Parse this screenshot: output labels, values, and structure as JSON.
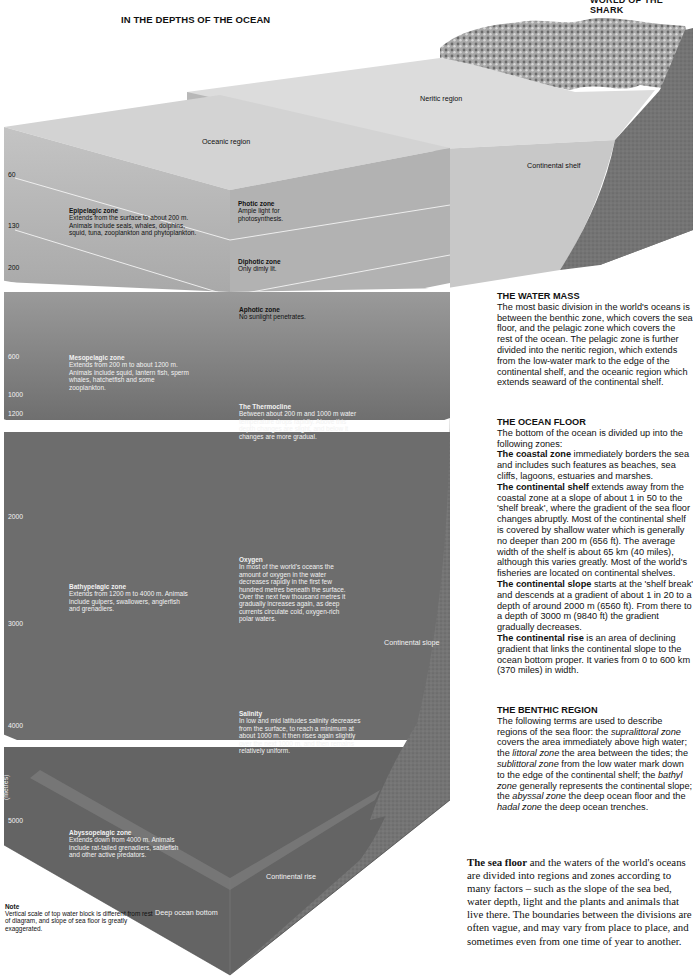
{
  "header": {
    "title": "IN THE DEPTHS OF THE OCEAN",
    "running_head": "WORLD OF THE SHARK"
  },
  "diagram": {
    "regions": {
      "neritic": "Neritic region",
      "oceanic": "Oceanic region",
      "continental_shelf": "Continental shelf",
      "continental_slope": "Continental slope",
      "continental_rise": "Continental rise",
      "deep_ocean_bottom": "Deep ocean bottom"
    },
    "depth_axis": {
      "unit_label": "(metres)",
      "ticks": [
        "60",
        "130",
        "200",
        "600",
        "1000",
        "1200",
        "2000",
        "3000",
        "4000",
        "5000"
      ]
    },
    "zones": [
      {
        "title": "Epipelagic zone",
        "text": "Extends from the surface to about 200 m. Animals include seals, whales, dolphins, squid, tuna, zooplankton and phytoplankton."
      },
      {
        "title": "Mesopelagic zone",
        "text": "Extends from 200 m to about 1200 m. Animals include squid, lantern fish, sperm whales, hatchetfish and some zooplankton."
      },
      {
        "title": "Bathypelagic zone",
        "text": "Extends from 1200 m to 4000 m. Animals include gulpers, swallowers, anglerfish and grenadiers."
      },
      {
        "title": "Abyssopelagic zone",
        "text": "Extends down from 4000 m. Animals include rat-tailed grenadiers, sablefish and other active predators."
      }
    ],
    "light_zones": [
      {
        "title": "Photic zone",
        "text": "Ample light for photosynthesis."
      },
      {
        "title": "Diphotic zone",
        "text": "Only dimly lit."
      },
      {
        "title": "Aphotic zone",
        "text": "No sunlight penetrates."
      }
    ],
    "properties": [
      {
        "title": "The Thermocline",
        "text": "Between about 200 m and 1000 m water temperature drops rapidly. Above this depth changes are slight, and below it changes are more gradual."
      },
      {
        "title": "Oxygen",
        "text": "In most of the world's oceans the amount of oxygen in the water decreases rapidly in the first few hundred metres beneath the surface. Over the next few thousand metres it gradually increases again, as deep currents circulate cold, oxygen-rich polar waters."
      },
      {
        "title": "Salinity",
        "text": "In low and mid latitudes salinity decreases from the surface, to reach a minimum at about 1000 m. It then rises again slightly over the next 1000 m, and then remains relatively uniform."
      }
    ],
    "note": {
      "title": "Note",
      "text": "Vertical scale of top water block is different from rest of diagram, and slope of sea floor is greatly exaggerated."
    }
  },
  "sidebar": {
    "water_mass": {
      "heading": "THE WATER MASS",
      "text": "The most basic division in the world's oceans is between the benthic zone, which covers the sea floor, and the pelagic zone which covers the rest of the ocean. The pelagic zone is further divided into the neritic region, which extends from the low-water mark to the edge of the continental shelf, and the oceanic region which extends seaward of the continental shelf."
    },
    "ocean_floor": {
      "heading": "THE OCEAN FLOOR",
      "intro": "The bottom of the ocean is divided up into the following zones:",
      "items": [
        {
          "term": "The coastal zone",
          "text": " immediately borders the sea and includes such features as beaches, sea cliffs, lagoons, estuaries and marshes."
        },
        {
          "term": "The continental shelf",
          "text": " extends away from the coastal zone at a slope of about 1 in 50 to the 'shelf break', where the gradient of the sea floor changes abruptly. Most of the continental shelf is covered by shallow water which is generally no deeper than 200 m (656 ft). The average width of the shelf is about 65 km (40 miles), although this varies greatly. Most of the world's fisheries are located on continental shelves."
        },
        {
          "term": "The continental slope",
          "text": " starts at the 'shelf break' and descends at a gradient of about 1 in 20 to a depth of around 2000 m (6560 ft). From there to a depth of 3000 m (9840 ft) the gradient gradually decreases."
        },
        {
          "term": "The continental rise",
          "text": " is an area of declining gradient that links the continental slope to the ocean bottom proper. It varies from 0 to 600 km (370 miles) in width."
        }
      ]
    },
    "benthic_region": {
      "heading": "THE BENTHIC REGION",
      "parts": [
        {
          "t": "The following terms are used to describe regions of the sea floor: the ",
          "i": false
        },
        {
          "t": "supralittoral zone",
          "i": true
        },
        {
          "t": " covers the area immediately above high water; the ",
          "i": false
        },
        {
          "t": "littoral zone",
          "i": true
        },
        {
          "t": " the area between the tides; the ",
          "i": false
        },
        {
          "t": "sublittoral zone",
          "i": true
        },
        {
          "t": " from the low water mark down to the edge of the continental shelf; the ",
          "i": false
        },
        {
          "t": "bathyl zone",
          "i": true
        },
        {
          "t": " generally represents the continental slope; the ",
          "i": false
        },
        {
          "t": "abyssal zone",
          "i": true
        },
        {
          "t": " the deep ocean floor and the ",
          "i": false
        },
        {
          "t": "hadal zone",
          "i": true
        },
        {
          "t": " the deep ocean trenches.",
          "i": false
        }
      ]
    },
    "intro": {
      "lead": "The sea floor",
      "text": " and the waters of the world's oceans are divided into regions and zones according to many factors – such as the slope of the sea bed, water depth, light and the plants and animals that live there. The boundaries between the divisions are often vague, and may vary from place to place, and sometimes even from one time of year to another."
    }
  },
  "colors": {
    "surface_top": "#d6d6d6",
    "upper_block_front": "#bdbdbd",
    "upper_block_side": "#b0b0b0",
    "mid_block": "#8a8a8a",
    "deep_block": "#6e6e6e",
    "seabed": "#5c5c5c",
    "land": "#7a7a7a"
  }
}
